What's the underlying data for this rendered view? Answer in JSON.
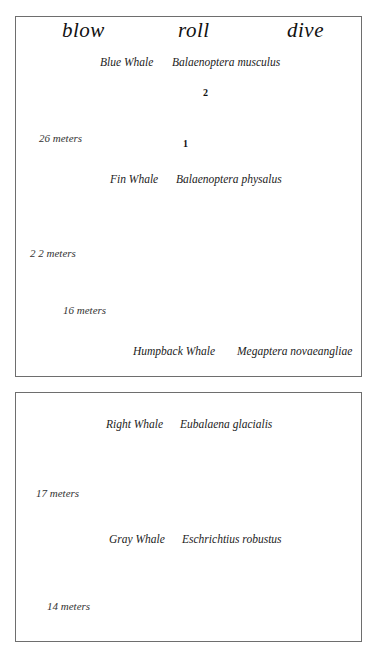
{
  "columns": {
    "blow": "blow",
    "roll": "roll",
    "dive": "dive"
  },
  "panels": [
    {
      "id": "panel-1",
      "whales": [
        {
          "common_name": "Blue Whale",
          "scientific_name": "Balaenoptera musculus",
          "length_label": "26 meters",
          "roll_sequence": [
            "2",
            "1"
          ]
        },
        {
          "common_name": "Fin Whale",
          "scientific_name": "Balaenoptera physalus",
          "length_label": "2 2 meters"
        },
        {
          "common_name": "Humpback Whale",
          "scientific_name": "Megaptera novaeangliae",
          "length_label": "16 meters"
        }
      ]
    },
    {
      "id": "panel-2",
      "whales": [
        {
          "common_name": "Right Whale",
          "scientific_name": "Eubalaena glacialis",
          "length_label": "17 meters"
        },
        {
          "common_name": "Gray Whale",
          "scientific_name": "Eschrichtius robustus",
          "length_label": "14 meters"
        }
      ]
    }
  ],
  "colors": {
    "ink": "#111111",
    "border": "#6e6e6e",
    "water": "#555555",
    "background": "#ffffff"
  }
}
